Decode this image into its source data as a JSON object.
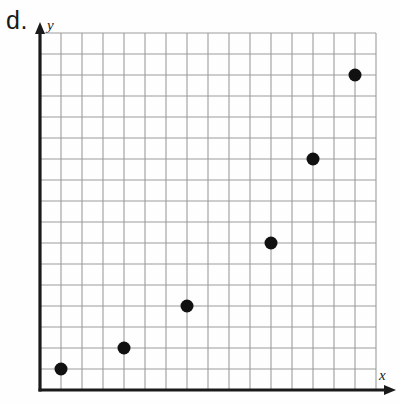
{
  "figure": {
    "part_label": "d.",
    "axis_labels": {
      "x": "x",
      "y": "y"
    }
  },
  "chart_data": {
    "type": "scatter",
    "title": "",
    "xlabel": "x",
    "ylabel": "y",
    "grid": true,
    "legend": null,
    "xlim": [
      0,
      16
    ],
    "ylim": [
      0,
      17
    ],
    "tick_labels": {
      "x": [],
      "y": []
    },
    "grid_cells": {
      "columns": 16,
      "rows": 17,
      "cell_px": 21
    },
    "series": [
      {
        "name": "points",
        "marker": "filled-circle",
        "color": "#111111",
        "marker_size_px": 13,
        "points": [
          {
            "x": 1,
            "y": 1
          },
          {
            "x": 4,
            "y": 2
          },
          {
            "x": 7,
            "y": 4
          },
          {
            "x": 11,
            "y": 7
          },
          {
            "x": 13,
            "y": 11
          },
          {
            "x": 15,
            "y": 15
          }
        ]
      }
    ],
    "annotations": []
  },
  "colors": {
    "grid_line": "#9c9c9c",
    "axis": "#1a1a1a",
    "point": "#111111",
    "background": "#fefefe"
  }
}
